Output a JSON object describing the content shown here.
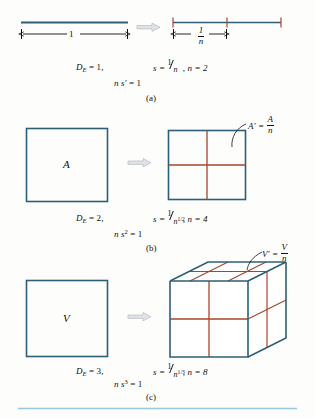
{
  "figure": {
    "colors": {
      "line_blue": "#2e5f77",
      "divider_red": "#a8452a",
      "arrow_gray": "#cfd3d6",
      "arrow_stroke": "#9aa1a6",
      "rule_blue": "#9cc7e0",
      "text": "#111111"
    },
    "bottom_rule": true
  },
  "panels": [
    {
      "id": "a",
      "label": "(a)",
      "left": {
        "type": "line-segment",
        "dimension_label": "1"
      },
      "right": {
        "type": "line-segment-divided",
        "segments": 2,
        "segment_label_num": "1",
        "segment_label_den": "n"
      },
      "equations": {
        "de": "D",
        "de_sub": "E",
        "de_value": "= 1,",
        "ns": "n s",
        "ns_prime": "′",
        "ns_value": "= 1",
        "s_lead": "s  =",
        "s_num": "1",
        "s_den": "n",
        "s_den_power": "",
        "n_value": ", n = 2"
      }
    },
    {
      "id": "b",
      "label": "(b)",
      "left": {
        "type": "square",
        "letter": "A"
      },
      "right": {
        "type": "square-divided",
        "rows": 2,
        "cols": 2,
        "callout_lead": "A′  =",
        "callout_num": "A",
        "callout_den": "n"
      },
      "equations": {
        "de": "D",
        "de_sub": "E",
        "de_value": "= 2,",
        "ns": "n s",
        "ns_sup": "2",
        "ns_value": "= 1",
        "s_lead": "s  =",
        "s_num": "1",
        "s_den": "n",
        "s_den_power": "1/2",
        "n_value": ", n = 4"
      }
    },
    {
      "id": "c",
      "label": "(c)",
      "left": {
        "type": "square",
        "letter": "V"
      },
      "right": {
        "type": "cube-divided",
        "divisions": 2,
        "callout_lead": "V′  =",
        "callout_num": "V",
        "callout_den": "n"
      },
      "equations": {
        "de": "D",
        "de_sub": "E",
        "de_value": "= 3,",
        "ns": "n s",
        "ns_sup": "3",
        "ns_value": "= 1",
        "s_lead": "s  =",
        "s_num": "1",
        "s_den": "n",
        "s_den_power": "1/3",
        "n_value": ", n = 8"
      }
    }
  ]
}
